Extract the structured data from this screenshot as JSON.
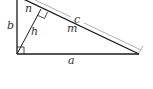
{
  "diagram": {
    "type": "right-triangle-altitude",
    "labels": {
      "a": "a",
      "b": "b",
      "c": "c",
      "h": "h",
      "m": "m",
      "n": "n"
    },
    "colors": {
      "line": "#1a1a1a",
      "dimension_line": "#9a9a9a",
      "label": "#333333"
    }
  }
}
